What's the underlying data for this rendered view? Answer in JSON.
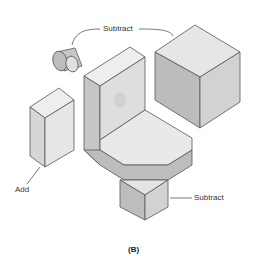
{
  "figure": {
    "caption": "(B)",
    "labels": {
      "subtract_top": "Subtract",
      "add": "Add",
      "subtract_bottom": "Subtract"
    },
    "parts": [
      {
        "name": "cylinder",
        "operation": "Subtract"
      },
      {
        "name": "cube",
        "operation": "Subtract"
      },
      {
        "name": "l-bracket",
        "operation": "Base"
      },
      {
        "name": "hexagonal-prism",
        "operation": "Add"
      },
      {
        "name": "triangular-prism",
        "operation": "Subtract"
      }
    ],
    "colors": {
      "light": "#ececec",
      "mid": "#d4d4d4",
      "dark": "#b8b8b8",
      "outline": "#555555"
    }
  }
}
